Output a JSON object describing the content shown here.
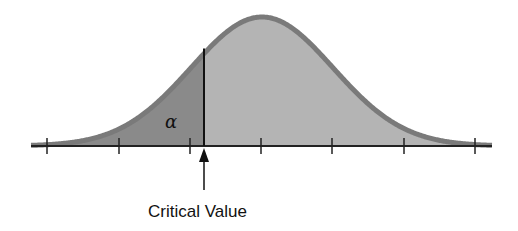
{
  "diagram": {
    "type": "normal-distribution-critical-region",
    "alpha_label": "α",
    "critical_label": "Critical Value",
    "colors": {
      "tail_fill": "#8a8a8a",
      "body_fill": "#b4b4b4",
      "curve_stroke": "#7a7a7a",
      "axis": "#222222",
      "text": "#111111"
    },
    "axis": {
      "x_start": 31,
      "x_end": 492,
      "y": 146
    },
    "ticks_x": [
      47,
      119,
      190,
      261,
      332,
      404,
      475
    ],
    "curve": {
      "mean_x": 262,
      "sd_px": 71,
      "peak_y": 17
    },
    "critical_x": 204
  }
}
